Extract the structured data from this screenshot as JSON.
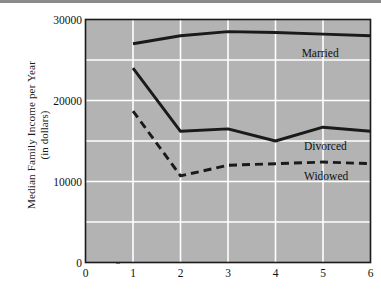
{
  "chart_data": {
    "type": "line",
    "title": "",
    "xlabel": "",
    "ylabel": "Median Family Income per Year",
    "ylabel_line2": "(in dollars)",
    "x": [
      1,
      2,
      3,
      4,
      5,
      6
    ],
    "xticks": [
      "0",
      "1",
      "2",
      "3",
      "4",
      "5",
      "6"
    ],
    "xtick_values": [
      0,
      1,
      2,
      3,
      4,
      5,
      6
    ],
    "yticks": [
      "0",
      "10000",
      "20000",
      "30000"
    ],
    "ytick_values": [
      0,
      10000,
      20000,
      30000
    ],
    "xlim": [
      0,
      6
    ],
    "ylim": [
      0,
      30000
    ],
    "grid": true,
    "grid_y_values": [
      5000,
      10000,
      15000,
      20000,
      25000
    ],
    "grid_x_values": [
      1,
      2,
      3,
      4,
      5
    ],
    "plot_background": "#b3b3b3",
    "grid_color": "#ffffff",
    "line_color": "#1a1a1a",
    "legend_position": "inline-right",
    "series": [
      {
        "name": "Married",
        "style": "solid",
        "values": [
          27000,
          28000,
          28500,
          28400,
          28200,
          28000
        ],
        "label": "Married",
        "label_x": 4.55,
        "label_y": 25800
      },
      {
        "name": "Divorced",
        "style": "solid",
        "values": [
          24000,
          16200,
          16500,
          15000,
          16700,
          16200
        ],
        "label": "Divorced",
        "label_x": 4.6,
        "label_y": 14300
      },
      {
        "name": "Widowed",
        "style": "dashed",
        "values": [
          18700,
          10700,
          12000,
          12200,
          12400,
          12200
        ],
        "label": "Widowed",
        "label_x": 4.6,
        "label_y": 10600
      }
    ]
  }
}
